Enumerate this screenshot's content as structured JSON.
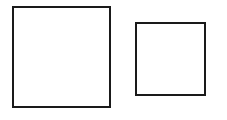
{
  "diagram": {
    "shapes": [
      {
        "type": "square",
        "size": "large",
        "stroke": "#1a1a1a",
        "fill": "#ffffff"
      },
      {
        "type": "square",
        "size": "small",
        "stroke": "#1a1a1a",
        "fill": "#ffffff"
      }
    ]
  }
}
